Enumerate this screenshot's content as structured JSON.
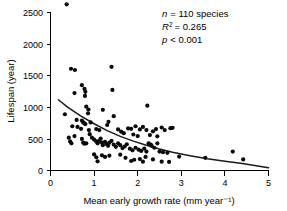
{
  "chart_data": {
    "type": "scatter",
    "title": "",
    "xlabel": "Mean early growth rate (mm year⁻¹)",
    "ylabel": "Lifespan (year)",
    "xlim": [
      0,
      5
    ],
    "ylim": [
      0,
      2700
    ],
    "xticks": [
      0,
      1,
      2,
      3,
      4,
      5
    ],
    "xtick_labels": [
      "0",
      "1",
      "2",
      "3",
      "4",
      "5"
    ],
    "yticks": [
      0,
      500,
      1000,
      1500,
      2000,
      2500
    ],
    "ytick_labels": [
      "0",
      "500",
      "1000",
      "1500",
      "2000",
      "2500"
    ],
    "grid": false,
    "legend": false,
    "marker_color": "#0a0a0a",
    "curve_color": "#1a1a1a",
    "annotations": {
      "n_label": "n",
      "n_value": "= 110 species",
      "r2_label": "R",
      "r2_sup": "2",
      "r2_value": "= 0.265",
      "p_label": "p",
      "p_value": "< 0.001"
    },
    "series": [
      {
        "name": "species",
        "points": [
          [
            0.37,
            2630
          ],
          [
            0.47,
            1610
          ],
          [
            0.56,
            1590
          ],
          [
            0.72,
            1350
          ],
          [
            0.55,
            1225
          ],
          [
            0.78,
            1290
          ],
          [
            0.8,
            1245
          ],
          [
            0.79,
            1180
          ],
          [
            1.4,
            1640
          ],
          [
            1.42,
            1275
          ],
          [
            2.22,
            1025
          ],
          [
            0.82,
            1010
          ],
          [
            0.87,
            965
          ],
          [
            1.2,
            960
          ],
          [
            0.33,
            890
          ],
          [
            0.86,
            905
          ],
          [
            1.45,
            860
          ],
          [
            0.6,
            800
          ],
          [
            0.72,
            790
          ],
          [
            0.75,
            760
          ],
          [
            0.78,
            745
          ],
          [
            0.8,
            735
          ],
          [
            0.92,
            760
          ],
          [
            1.33,
            770
          ],
          [
            1.3,
            720
          ],
          [
            0.5,
            700
          ],
          [
            0.62,
            690
          ],
          [
            0.7,
            660
          ],
          [
            0.88,
            640
          ],
          [
            1.05,
            655
          ],
          [
            1.12,
            640
          ],
          [
            1.55,
            650
          ],
          [
            1.62,
            615
          ],
          [
            1.78,
            665
          ],
          [
            1.85,
            660
          ],
          [
            1.95,
            700
          ],
          [
            2.05,
            650
          ],
          [
            2.12,
            690
          ],
          [
            2.2,
            640
          ],
          [
            2.35,
            620
          ],
          [
            2.42,
            655
          ],
          [
            2.55,
            680
          ],
          [
            2.62,
            640
          ],
          [
            2.75,
            670
          ],
          [
            2.8,
            675
          ],
          [
            1.68,
            590
          ],
          [
            1.9,
            570
          ],
          [
            2.0,
            545
          ],
          [
            2.28,
            560
          ],
          [
            2.45,
            540
          ],
          [
            0.42,
            520
          ],
          [
            0.45,
            460
          ],
          [
            0.48,
            430
          ],
          [
            0.55,
            545
          ],
          [
            0.72,
            500
          ],
          [
            0.75,
            440
          ],
          [
            0.78,
            425
          ],
          [
            0.82,
            430
          ],
          [
            0.9,
            575
          ],
          [
            0.95,
            520
          ],
          [
            1.0,
            490
          ],
          [
            1.05,
            460
          ],
          [
            1.08,
            430
          ],
          [
            1.12,
            470
          ],
          [
            1.15,
            505
          ],
          [
            1.18,
            440
          ],
          [
            1.2,
            400
          ],
          [
            1.25,
            455
          ],
          [
            1.28,
            420
          ],
          [
            1.32,
            390
          ],
          [
            1.35,
            440
          ],
          [
            1.4,
            470
          ],
          [
            1.45,
            410
          ],
          [
            1.5,
            375
          ],
          [
            1.55,
            430
          ],
          [
            1.6,
            400
          ],
          [
            1.65,
            355
          ],
          [
            1.7,
            380
          ],
          [
            1.75,
            415
          ],
          [
            1.82,
            345
          ],
          [
            1.88,
            320
          ],
          [
            1.95,
            360
          ],
          [
            2.02,
            330
          ],
          [
            2.08,
            310
          ],
          [
            2.15,
            345
          ],
          [
            2.2,
            300
          ],
          [
            2.25,
            430
          ],
          [
            2.3,
            410
          ],
          [
            2.32,
            390
          ],
          [
            2.38,
            360
          ],
          [
            2.45,
            430
          ],
          [
            2.5,
            300
          ],
          [
            2.58,
            290
          ],
          [
            2.68,
            280
          ],
          [
            1.0,
            255
          ],
          [
            1.05,
            210
          ],
          [
            1.08,
            145
          ],
          [
            1.18,
            240
          ],
          [
            1.25,
            215
          ],
          [
            1.35,
            235
          ],
          [
            1.6,
            250
          ],
          [
            1.72,
            200
          ],
          [
            1.85,
            150
          ],
          [
            1.92,
            170
          ],
          [
            2.05,
            180
          ],
          [
            2.12,
            140
          ],
          [
            2.18,
            215
          ],
          [
            2.35,
            175
          ],
          [
            2.55,
            140
          ],
          [
            2.72,
            135
          ],
          [
            2.95,
            220
          ],
          [
            3.55,
            200
          ],
          [
            4.18,
            300
          ],
          [
            4.42,
            175
          ]
        ]
      }
    ],
    "fit": {
      "name": "regression-curve",
      "description": "decaying exponential fit",
      "points": [
        [
          0.18,
          1120
        ],
        [
          0.4,
          1000
        ],
        [
          0.7,
          860
        ],
        [
          1.0,
          740
        ],
        [
          1.3,
          630
        ],
        [
          1.6,
          540
        ],
        [
          1.9,
          465
        ],
        [
          2.2,
          400
        ],
        [
          2.5,
          340
        ],
        [
          2.8,
          290
        ],
        [
          3.2,
          235
        ],
        [
          3.6,
          185
        ],
        [
          4.0,
          145
        ],
        [
          4.4,
          110
        ],
        [
          5.0,
          45
        ]
      ]
    }
  }
}
